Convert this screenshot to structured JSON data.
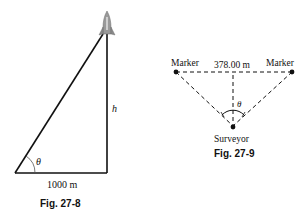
{
  "figures": [
    {
      "caption": "Fig. 27-8",
      "labels": {
        "base": "1000 m",
        "height": "h",
        "angle": "θ"
      },
      "icons": [
        "rocket-icon"
      ]
    },
    {
      "caption": "Fig. 27-9",
      "labels": {
        "left_marker": "Marker",
        "right_marker": "Marker",
        "distance": "378.00 m",
        "angle": "θ",
        "observer": "Surveyor"
      }
    }
  ]
}
